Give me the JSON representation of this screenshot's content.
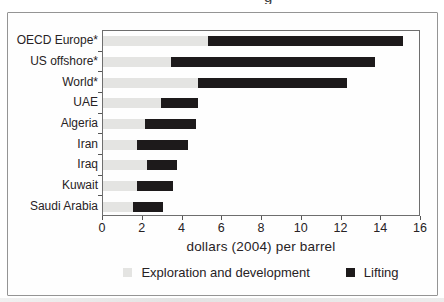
{
  "figure": {
    "cropped_title_fragment": "g",
    "background": "#fefefe",
    "frame_border_color": "#949494",
    "plot_border_color": "#6e6e6e",
    "text_color": "#272224",
    "legend": [
      {
        "label": "Exploration and development",
        "color": "#e4e4e2"
      },
      {
        "label": "Lifting",
        "color": "#1d1a1b"
      }
    ]
  },
  "chart_data": {
    "type": "bar",
    "orientation": "horizontal",
    "stacked": true,
    "title": "",
    "xlabel": "dollars (2004) per barrel",
    "ylabel": "",
    "xlim": [
      0,
      16
    ],
    "xticks": [
      0,
      2,
      4,
      6,
      8,
      10,
      12,
      14,
      16
    ],
    "grid": false,
    "legend_position": "bottom",
    "categories": [
      "OECD Europe*",
      "US offshore*",
      "World*",
      "UAE",
      "Algeria",
      "Iran",
      "Iraq",
      "Kuwait",
      "Saudi Arabia"
    ],
    "series": [
      {
        "name": "Exploration and development",
        "color": "#e4e4e2",
        "values": [
          5.3,
          3.4,
          4.8,
          2.9,
          2.1,
          1.7,
          2.2,
          1.7,
          1.5
        ]
      },
      {
        "name": "Lifting",
        "color": "#1d1a1b",
        "values": [
          9.8,
          10.3,
          7.5,
          1.9,
          2.6,
          2.6,
          1.5,
          1.8,
          1.5
        ]
      }
    ],
    "totals": [
      15.1,
      13.7,
      12.3,
      4.8,
      4.7,
      4.3,
      3.7,
      3.5,
      3.0
    ]
  }
}
